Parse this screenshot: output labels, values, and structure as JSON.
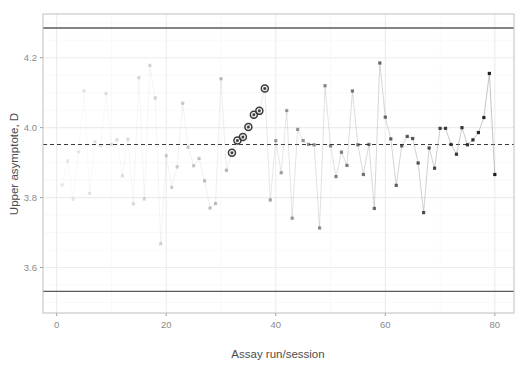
{
  "chart_data": {
    "type": "line",
    "title": "",
    "subtitle": "",
    "xlabel": "Assay run/session",
    "ylabel": "Upper asymptote, D",
    "xlim": [
      -2.5,
      83.5
    ],
    "ylim": [
      3.47,
      4.325
    ],
    "xticks": [
      0,
      20,
      40,
      60,
      80
    ],
    "xticklabels": [
      "0",
      "20",
      "40",
      "60",
      "80"
    ],
    "yticks": [
      3.6,
      3.8,
      4.0,
      4.2
    ],
    "yticklabels": [
      "3.6",
      "3.8",
      "4.0",
      "4.2"
    ],
    "grid": true,
    "grid_color": "#f2f2f2",
    "panel_background": "#ffffff",
    "panel_border_color": "#bfbfbf",
    "legend": "none",
    "series_name": "Upper asymptote D",
    "marker": "filled-square",
    "line_color": "#9a9a9a",
    "reference_lines": [
      {
        "name": "upper-control-limit",
        "value": 4.285,
        "style": "solid",
        "color": "#5a5a5a"
      },
      {
        "name": "center-line-mean",
        "value": 3.952,
        "style": "dashed",
        "color": "#3c3c3c"
      },
      {
        "name": "lower-control-limit",
        "value": 3.532,
        "style": "solid",
        "color": "#5a5a5a"
      }
    ],
    "highlight": {
      "name": "run-trend-flag",
      "marker": "circled-point",
      "color": "#3a3a3a",
      "x": [
        32,
        33,
        34,
        35,
        36,
        37,
        38
      ],
      "y": [
        3.928,
        3.963,
        3.973,
        4.002,
        4.037,
        4.048,
        4.112
      ]
    },
    "x": [
      1,
      2,
      3,
      4,
      5,
      6,
      7,
      8,
      9,
      10,
      11,
      12,
      13,
      14,
      15,
      16,
      17,
      18,
      19,
      20,
      21,
      22,
      23,
      24,
      25,
      26,
      27,
      28,
      29,
      30,
      31,
      32,
      33,
      34,
      35,
      36,
      37,
      38,
      39,
      40,
      41,
      42,
      43,
      44,
      45,
      46,
      47,
      48,
      49,
      50,
      51,
      52,
      53,
      54,
      55,
      56,
      57,
      58,
      59,
      60,
      61,
      62,
      63,
      64,
      65,
      66,
      67,
      68,
      69,
      70,
      71,
      72,
      73,
      74,
      75,
      76,
      77,
      78,
      79,
      80
    ],
    "values": [
      3.836,
      3.905,
      3.795,
      3.931,
      4.106,
      3.812,
      3.96,
      3.949,
      4.098,
      3.952,
      3.965,
      3.862,
      3.967,
      3.782,
      4.143,
      3.796,
      4.178,
      4.085,
      3.668,
      3.92,
      3.829,
      3.888,
      4.07,
      3.944,
      3.891,
      3.912,
      3.848,
      3.77,
      3.783,
      4.14,
      3.878,
      3.928,
      3.963,
      3.973,
      4.002,
      4.037,
      4.048,
      4.112,
      3.793,
      3.963,
      3.871,
      4.049,
      3.741,
      3.995,
      3.963,
      3.952,
      3.951,
      3.713,
      4.12,
      3.948,
      3.86,
      3.93,
      3.892,
      4.105,
      3.951,
      3.866,
      3.952,
      3.769,
      4.185,
      4.03,
      3.968,
      3.835,
      3.948,
      3.975,
      3.969,
      3.899,
      3.757,
      3.942,
      3.884,
      3.998,
      3.998,
      3.952,
      3.924,
      4.0,
      3.951,
      3.965,
      3.986,
      4.029,
      4.155,
      3.866
    ],
    "n_points": 80
  },
  "axes": {
    "y_label_text": "Upper asymptote, D",
    "x_label_text": "Assay run/session"
  }
}
